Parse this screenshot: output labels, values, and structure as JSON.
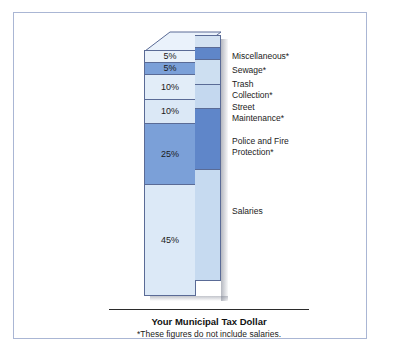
{
  "frame": {
    "border_color": "#aab6d4",
    "background": "#ffffff"
  },
  "caption": {
    "title": "Your Municipal Tax Dollar",
    "note": "*These figures do not include salaries."
  },
  "colors": {
    "light": "#d6e4f3",
    "pale": "#e9f1fa",
    "medium": "#7ba0d8",
    "medium_dark": "#5f86c9",
    "outline": "#5a6b96",
    "side_light": "#bed2ea",
    "side_pale": "#d3e2f2",
    "side_medium": "#5f86c9",
    "side_medium_dark": "#476fb8",
    "cap_top": "#eaf2fb",
    "shadow": "#787d8c"
  },
  "chart_data": {
    "type": "bar",
    "orientation": "vertical-stacked-3d",
    "title": "Your Municipal Tax Dollar",
    "subtitle": "*These figures do not include salaries.",
    "xlabel": "",
    "ylabel": "",
    "unit": "percent",
    "total": 100,
    "legend_position": "right",
    "grid": false,
    "categories": [
      "Miscellaneous*",
      "Sewage*",
      "Trash Collection*",
      "Street Maintenance*",
      "Police and Fire Protection*",
      "Salaries"
    ],
    "values": [
      5,
      5,
      10,
      10,
      25,
      45
    ],
    "segments": [
      {
        "label": "Miscellaneous*",
        "label_lines": "Miscellaneous*",
        "value": 5,
        "pct_text": "5%",
        "front_color": "#e9f1fa",
        "side_color": "#d3e2f2"
      },
      {
        "label": "Sewage*",
        "label_lines": "Sewage*",
        "value": 5,
        "pct_text": "5%",
        "front_color": "#7ba0d8",
        "side_color": "#5f86c9"
      },
      {
        "label": "Trash Collection*",
        "label_lines": "Trash\nCollection*",
        "value": 10,
        "pct_text": "10%",
        "front_color": "#e2edf8",
        "side_color": "#cddff1"
      },
      {
        "label": "Street Maintenance*",
        "label_lines": "Street\nMaintenance*",
        "value": 10,
        "pct_text": "10%",
        "front_color": "#dbe8f6",
        "side_color": "#c4d8ef"
      },
      {
        "label": "Police and Fire Protection*",
        "label_lines": "Police and Fire\nProtection*",
        "value": 25,
        "pct_text": "25%",
        "front_color": "#7ba0d8",
        "side_color": "#5f86c9"
      },
      {
        "label": "Salaries",
        "label_lines": "Salaries",
        "value": 45,
        "pct_text": "45%",
        "front_color": "#dce9f7",
        "side_color": "#c6daf0"
      }
    ]
  }
}
